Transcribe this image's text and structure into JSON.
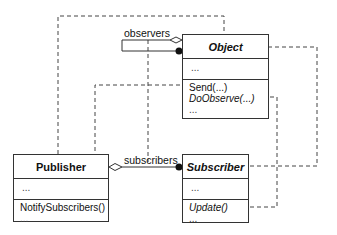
{
  "diagram": {
    "type": "UML class diagram",
    "classes": [
      {
        "id": "object",
        "name": "Object",
        "abstract": true,
        "attributes": [
          "..."
        ],
        "operations": [
          {
            "text": "Send(...)",
            "italic": false
          },
          {
            "text": "DoObserve(...)",
            "italic": true
          },
          {
            "text": "...",
            "italic": false
          }
        ]
      },
      {
        "id": "publisher",
        "name": "Publisher",
        "abstract": false,
        "attributes": [
          "..."
        ],
        "operations": [
          {
            "text": "NotifySubscribers()",
            "italic": false
          },
          {
            "text": "...",
            "italic": false
          }
        ]
      },
      {
        "id": "subscriber",
        "name": "Subscriber",
        "abstract": true,
        "attributes": [
          "..."
        ],
        "operations": [
          {
            "text": "Update()",
            "italic": true
          },
          {
            "text": "...",
            "italic": false
          }
        ]
      }
    ],
    "associations": [
      {
        "label": "observers",
        "from": "object",
        "to": "object",
        "kind": "aggregation-self"
      },
      {
        "label": "subscribers",
        "from": "publisher",
        "to": "subscriber",
        "kind": "aggregation"
      }
    ],
    "line_color": "#333333"
  }
}
